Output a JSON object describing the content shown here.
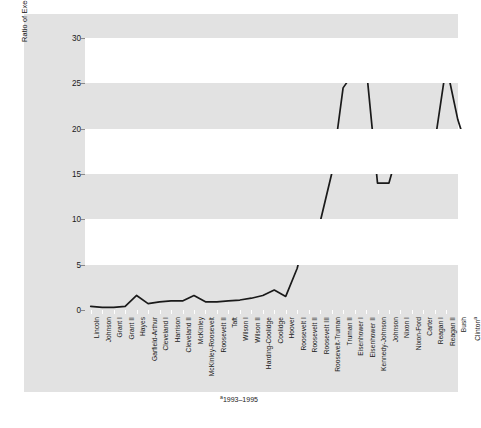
{
  "chart_data": {
    "type": "line",
    "title": "",
    "xlabel": "",
    "ylabel": "Ratio of Executive Agreements to Treaties",
    "ylim": [
      0,
      30
    ],
    "yticks": [
      0,
      5,
      10,
      15,
      20,
      25,
      30
    ],
    "grid": "horizontal-banded",
    "legend": "none",
    "categories": [
      "Lincoln",
      "Johnson",
      "Grant I",
      "Grant II",
      "Hayes",
      "Garfield-Arthur",
      "Cleveland I",
      "Harrison",
      "Cleveland II",
      "McKinley",
      "McKinley-Roosevelt",
      "Roosevelt II",
      "Taft",
      "Wilson I",
      "Wilson II",
      "Harding-Coolidge",
      "Coolidge",
      "Hoover",
      "Roosevelt I",
      "Roosevelt II",
      "Roosevelt III",
      "Roosevelt-Truman",
      "Truman II",
      "Eisenhower I",
      "Eisenhower II",
      "Kennedy-Johnson",
      "Johnson",
      "Nixon I",
      "Nixon-Ford",
      "Carter",
      "Reagan I",
      "Reagan II",
      "Bush",
      "Clinton"
    ],
    "values": [
      0.4,
      0.3,
      0.3,
      0.4,
      1.6,
      0.7,
      0.9,
      1.0,
      1.0,
      1.6,
      0.9,
      0.9,
      1.0,
      1.1,
      1.3,
      1.6,
      2.2,
      1.5,
      4.6,
      9.7,
      9.7,
      15.0,
      24.5,
      26.3,
      27.0,
      14.0,
      14.0,
      18.5,
      17.1,
      19.0,
      18.5,
      27.0,
      21.0,
      17.0
    ],
    "footnote_marker": "a",
    "footnote": "1993–1995",
    "line_color": "#1a1a1a",
    "band_color": "#e2e2e2",
    "plot_bg": "#ffffff"
  },
  "axis": {
    "y_title": "Ratio of Executive Agreements to Treaties",
    "tick_labels": [
      "30",
      "25",
      "20",
      "15",
      "10",
      "5",
      "0"
    ]
  },
  "footnote_text": "1993–1995",
  "footnote_sup": "a"
}
